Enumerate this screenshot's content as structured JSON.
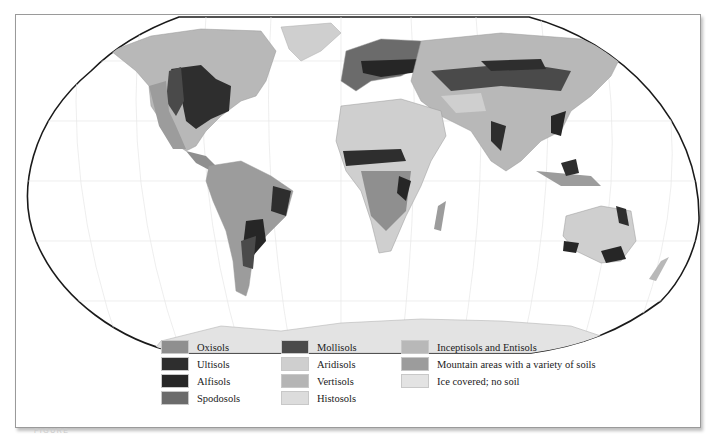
{
  "map": {
    "projection": "Robinson",
    "subject": "World soil orders",
    "background_color": "#ffffff",
    "land_palette": {
      "oxisols": "#8f8f8f",
      "ultisols": "#2e2e2e",
      "alfisols": "#262626",
      "spodosols": "#6b6b6b",
      "mollisols": "#4a4a4a",
      "aridisols": "#cfcfcf",
      "vertisols": "#b5b5b5",
      "histosols": "#dcdcdc",
      "inceptisols_entisols": "#b8b8b8",
      "mountain": "#9c9c9c",
      "ice": "#e3e3e3"
    }
  },
  "legend": {
    "columns": [
      {
        "items": [
          {
            "label": "Oxisols",
            "color": "#8f8f8f"
          },
          {
            "label": "Ultisols",
            "color": "#2e2e2e"
          },
          {
            "label": "Alfisols",
            "color": "#262626"
          },
          {
            "label": "Spodosols",
            "color": "#6b6b6b"
          }
        ]
      },
      {
        "items": [
          {
            "label": "Mollisols",
            "color": "#4a4a4a"
          },
          {
            "label": "Aridisols",
            "color": "#cfcfcf"
          },
          {
            "label": "Vertisols",
            "color": "#b5b5b5"
          },
          {
            "label": "Histosols",
            "color": "#dcdcdc"
          }
        ]
      },
      {
        "items": [
          {
            "label": "Inceptisols and Entisols",
            "color": "#b8b8b8"
          },
          {
            "label": "Mountain areas with a variety of soils",
            "color": "#9c9c9c"
          },
          {
            "label": "Ice covered; no soil",
            "color": "#e3e3e3"
          }
        ]
      }
    ]
  },
  "caption": {
    "text": "FIGURE"
  }
}
